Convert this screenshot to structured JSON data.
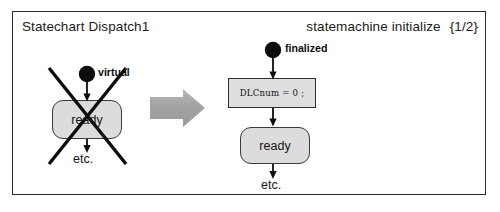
{
  "figure": {
    "kind": "uml-statechart-transformation-figure",
    "header": {
      "title": "Statechart Dispatch1",
      "right_label": "statemachine initialize",
      "right_counter": "{1/2}"
    },
    "before": {
      "crossed_out": true,
      "initial_pseudostate_label": "virtual",
      "state_label": "ready",
      "continuation_label": "etc."
    },
    "transform_arrow": {
      "name": "transformation-arrow",
      "direction": "right",
      "fill": "#a8a8a8"
    },
    "after": {
      "initial_pseudostate_label": "finalized",
      "action_code": "DLCnum = 0 ;",
      "state_label": "ready",
      "continuation_label": "etc."
    },
    "colors": {
      "frame_border": "#2b2b2b",
      "state_fill": "#dcdcdc",
      "state_border": "#3a3a3a",
      "code_fill": "#dedede",
      "ink": "#121212",
      "arrow_gray": "#a8a8a8",
      "page_background": "#ffffff"
    }
  }
}
